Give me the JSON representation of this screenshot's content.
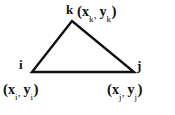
{
  "figure": {
    "name": "triangle-element-with-nodal-coordinates",
    "background_color": "#ffffff",
    "line_color": "#111111",
    "text_color": "#111111"
  },
  "triangle": {
    "stroke_width": 2.4,
    "vertices": [
      {
        "id": "k",
        "x": 72,
        "y": 21
      },
      {
        "id": "i",
        "x": 32,
        "y": 72
      },
      {
        "id": "j",
        "x": 134,
        "y": 72
      }
    ]
  },
  "nodes": {
    "k": {
      "letter": "k",
      "open_paren": "(",
      "x_var": "x",
      "x_sub": "k",
      "comma": ",",
      "y_var": "y",
      "y_sub": "k",
      "close_paren": ")"
    },
    "i": {
      "letter": "i",
      "open_paren": "(",
      "x_var": "x",
      "x_sub": "i",
      "comma": ",",
      "y_var": "y",
      "y_sub": "i",
      "close_paren": ")"
    },
    "j": {
      "letter": "j",
      "open_paren": "(",
      "x_var": "x",
      "x_sub": "j",
      "comma": ",",
      "y_var": "y",
      "y_sub": "j",
      "close_paren": ")"
    }
  }
}
